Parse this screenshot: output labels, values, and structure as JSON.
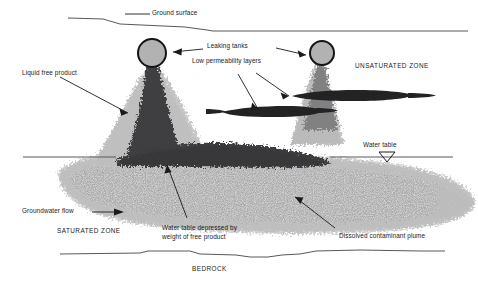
{
  "diagram": {
    "colors": {
      "free_product_dark": "#3a3a3c",
      "dissolved_plume_gray": "#a8a8a8",
      "halo_gray": "#bcbcbc",
      "tank_fill": "#b0b0b0",
      "tank_stroke": "#1a1a1a",
      "line": "#58585a",
      "text": "#1a1a1a",
      "background": "#ffffff"
    },
    "labels": {
      "ground_surface": "Ground surface",
      "leaking_tanks": "Leaking tanks",
      "low_permeability_layers": "Low permeability layers",
      "unsaturated_zone": "UNSATURATED ZONE",
      "liquid_free_product": "Liquid free product",
      "water_table": "Water table",
      "groundwater_flow": "Groundwater flow",
      "saturated_zone": "SATURATED ZONE",
      "water_table_depressed_line1": "Water table depressed by",
      "water_table_depressed_line2": "weight of free product",
      "dissolved_contaminant_plume": "Dissolved contaminant plume",
      "bedrock": "BEDROCK"
    },
    "features": {
      "tank_left": {
        "cx": 152,
        "cy": 53,
        "r": 14
      },
      "tank_right": {
        "cx": 322,
        "cy": 53,
        "r": 12
      },
      "water_table_level_y": 157,
      "bedrock_level_y": 254,
      "low_permeability_upper": "upper dark lens extending right from beneath right tank",
      "low_permeability_lower": "lower dark lens extending left from beneath right tank",
      "water_table_symbol": "inverted-triangle"
    }
  }
}
